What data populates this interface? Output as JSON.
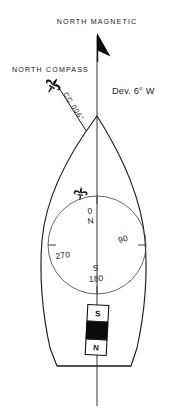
{
  "figure": {
    "type": "nautical-compass-deviation-diagram",
    "background_color": "#ffffff",
    "ink_color": "#1a1a1a"
  },
  "labels": {
    "north_magnetic": "NORTH  MAGNETIC",
    "north_compass": "NORTH  COMPASS",
    "deviation": "Dev. 6° W",
    "compass_course": "CC 006°"
  },
  "compass_rose": {
    "marks": [
      {
        "name": "north",
        "degrees": "0",
        "cardinal": "N"
      },
      {
        "name": "east",
        "degrees": "90",
        "cardinal": ""
      },
      {
        "name": "south",
        "degrees": "180",
        "cardinal": "S"
      },
      {
        "name": "west",
        "degrees": "270",
        "cardinal": ""
      }
    ],
    "lubber_marker": "fleur-de-lis"
  },
  "magnet": {
    "north_pole": "N",
    "south_pole": "S",
    "core_color": "#0b0b0b",
    "body_color": "#ffffff"
  },
  "icons": {
    "magnetic_north_arrow": "flag-arrowhead",
    "compass_north_marker": "fleur-de-lis",
    "rose_north_marker": "fleur-de-lis"
  }
}
